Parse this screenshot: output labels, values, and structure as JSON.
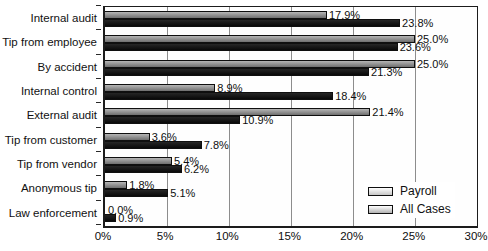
{
  "chart_data": {
    "type": "bar",
    "orientation": "horizontal",
    "title": "",
    "xlabel": "",
    "ylabel": "",
    "categories": [
      "Internal audit",
      "Tip from employee",
      "By accident",
      "Internal control",
      "External audit",
      "Tip from customer",
      "Tip from vendor",
      "Anonymous tip",
      "Law enforcement"
    ],
    "series": [
      {
        "name": "Payroll",
        "color": "#8e8e8e",
        "values": [
          17.9,
          25.0,
          25.0,
          8.9,
          21.4,
          3.6,
          5.4,
          1.8,
          0.0
        ]
      },
      {
        "name": "All Cases",
        "color": "#0d0d0d",
        "values": [
          23.8,
          23.6,
          21.3,
          18.4,
          10.9,
          7.8,
          6.2,
          5.1,
          0.9
        ]
      }
    ],
    "value_label_suffix": "%",
    "value_label_decimals": 1,
    "xlim": [
      0,
      30
    ],
    "x_tick_step": 5,
    "x_tick_labels": [
      "0%",
      "5%",
      "10%",
      "15%",
      "20%",
      "25%",
      "30%"
    ],
    "grid": "vertical",
    "legend_position": "inside-bottom-right"
  },
  "colors": {
    "payroll_bar": "#8e8e8e",
    "all_cases_bar": "#0d0d0d",
    "gridline": "#8d8d8d",
    "axis": "#1c1c1c",
    "text": "#0e0e0e",
    "background": "#ffffff"
  }
}
